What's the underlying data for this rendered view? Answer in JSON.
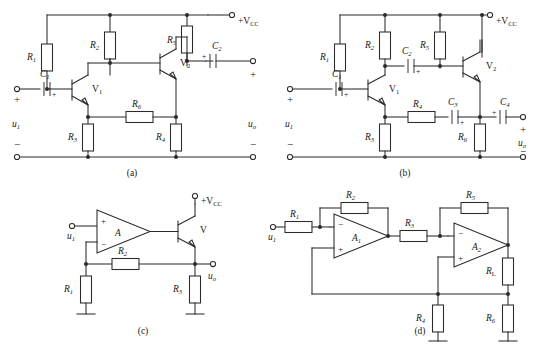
{
  "figure": {
    "type": "electronic-circuit-schematic-sheet",
    "panel_count": 4,
    "captions": [
      "(a)",
      "(b)",
      "(c)",
      "(d)"
    ]
  },
  "common": {
    "supply_label": "+V",
    "supply_sub": "CC",
    "input_label": "u",
    "input_sub": "1",
    "output_label": "u",
    "output_sub": "o",
    "plus": "+",
    "minus": "−"
  },
  "panel_a": {
    "caption": "(a)",
    "description": "Two-stage RC-coupled BJT amplifier with emitter feedback resistor",
    "supply": "+V",
    "supply_sub": "CC",
    "input_label": "u",
    "input_sub": "1",
    "output_label": "u",
    "output_sub": "o",
    "components": [
      {
        "name": "R",
        "sub": "1",
        "kind": "resistor",
        "orient": "vertical"
      },
      {
        "name": "R",
        "sub": "2",
        "kind": "resistor",
        "orient": "vertical"
      },
      {
        "name": "R",
        "sub": "3",
        "kind": "resistor",
        "orient": "vertical"
      },
      {
        "name": "R",
        "sub": "4",
        "kind": "resistor",
        "orient": "vertical"
      },
      {
        "name": "R",
        "sub": "5",
        "kind": "resistor",
        "orient": "vertical"
      },
      {
        "name": "R",
        "sub": "6",
        "kind": "resistor",
        "orient": "horizontal"
      },
      {
        "name": "C",
        "sub": "1",
        "kind": "capacitor-polarized",
        "orient": "horizontal"
      },
      {
        "name": "C",
        "sub": "2",
        "kind": "capacitor-polarized",
        "orient": "horizontal"
      },
      {
        "name": "V",
        "sub": "1",
        "kind": "transistor-npn"
      },
      {
        "name": "V",
        "sub": "2",
        "kind": "transistor-npn"
      }
    ]
  },
  "panel_b": {
    "caption": "(b)",
    "description": "Two-stage BJT amplifier with bypass capacitors and series feedback network",
    "supply": "+V",
    "supply_sub": "CC",
    "input_label": "u",
    "input_sub": "1",
    "output_label": "u",
    "output_sub": "o",
    "components": [
      {
        "name": "R",
        "sub": "1",
        "kind": "resistor",
        "orient": "vertical"
      },
      {
        "name": "R",
        "sub": "2",
        "kind": "resistor",
        "orient": "vertical"
      },
      {
        "name": "R",
        "sub": "3",
        "kind": "resistor",
        "orient": "vertical"
      },
      {
        "name": "R",
        "sub": "4",
        "kind": "resistor",
        "orient": "horizontal"
      },
      {
        "name": "R",
        "sub": "5",
        "kind": "resistor",
        "orient": "vertical"
      },
      {
        "name": "R",
        "sub": "6",
        "kind": "resistor",
        "orient": "vertical"
      },
      {
        "name": "C",
        "sub": "1",
        "kind": "capacitor-polarized",
        "orient": "horizontal"
      },
      {
        "name": "C",
        "sub": "2",
        "kind": "capacitor-polarized",
        "orient": "horizontal"
      },
      {
        "name": "C",
        "sub": "3",
        "kind": "capacitor-polarized",
        "orient": "horizontal"
      },
      {
        "name": "C",
        "sub": "4",
        "kind": "capacitor-polarized",
        "orient": "horizontal"
      },
      {
        "name": "V",
        "sub": "1",
        "kind": "transistor-npn"
      },
      {
        "name": "V",
        "sub": "2",
        "kind": "transistor-npn"
      }
    ]
  },
  "panel_c": {
    "caption": "(c)",
    "description": "Op-amp with BJT output booster and resistive feedback",
    "supply": "+V",
    "supply_sub": "CC",
    "input_label": "u",
    "input_sub": "1",
    "output_label": "u",
    "output_sub": "o",
    "opamp_label": "A",
    "opamp_plus": "+",
    "opamp_minus": "−",
    "transistor_label": "V",
    "components": [
      {
        "name": "R",
        "sub": "1",
        "kind": "resistor",
        "orient": "vertical"
      },
      {
        "name": "R",
        "sub": "2",
        "kind": "resistor",
        "orient": "horizontal"
      },
      {
        "name": "R",
        "sub": "3",
        "kind": "resistor",
        "orient": "vertical"
      },
      {
        "name": "V",
        "sub": "",
        "kind": "transistor-npn"
      }
    ]
  },
  "panel_d": {
    "caption": "(d)",
    "description": "Two op-amp cascade forming a current-source / feedback amplifier driving load R_L",
    "input_label": "u",
    "input_sub": "1",
    "opamp1_label": "A",
    "opamp1_sub": "1",
    "opamp2_label": "A",
    "opamp2_sub": "2",
    "opamp_plus": "+",
    "opamp_minus": "−",
    "components": [
      {
        "name": "R",
        "sub": "1",
        "kind": "resistor",
        "orient": "horizontal"
      },
      {
        "name": "R",
        "sub": "2",
        "kind": "resistor",
        "orient": "horizontal"
      },
      {
        "name": "R",
        "sub": "3",
        "kind": "resistor",
        "orient": "horizontal"
      },
      {
        "name": "R",
        "sub": "4",
        "kind": "resistor",
        "orient": "vertical"
      },
      {
        "name": "R",
        "sub": "5",
        "kind": "resistor",
        "orient": "horizontal"
      },
      {
        "name": "R",
        "sub": "6",
        "kind": "resistor",
        "orient": "vertical"
      },
      {
        "name": "R",
        "sub": "L",
        "sub_italic": false,
        "kind": "resistor",
        "orient": "vertical"
      }
    ]
  },
  "labels": {
    "a_R1": "R",
    "a_R1s": "1",
    "a_R2": "R",
    "a_R2s": "2",
    "a_R3": "R",
    "a_R3s": "3",
    "a_R4": "R",
    "a_R4s": "4",
    "a_R5": "R",
    "a_R5s": "5",
    "a_R6": "R",
    "a_R6s": "6",
    "a_C1": "C",
    "a_C1s": "1",
    "a_C2": "C",
    "a_C2s": "2",
    "a_V1": "V",
    "a_V1s": "1",
    "a_V2": "V",
    "a_V2s": "2",
    "b_R1": "R",
    "b_R1s": "1",
    "b_R2": "R",
    "b_R2s": "2",
    "b_R3": "R",
    "b_R3s": "3",
    "b_R4": "R",
    "b_R4s": "4",
    "b_R5": "R",
    "b_R5s": "5",
    "b_R6": "R",
    "b_R6s": "6",
    "b_C1": "C",
    "b_C1s": "1",
    "b_C2": "C",
    "b_C2s": "2",
    "b_C3": "C",
    "b_C3s": "3",
    "b_C4": "C",
    "b_C4s": "4",
    "b_V1": "V",
    "b_V1s": "1",
    "b_V2": "V",
    "b_V2s": "2",
    "c_R1": "R",
    "c_R1s": "1",
    "c_R2": "R",
    "c_R2s": "2",
    "c_R3": "R",
    "c_R3s": "3",
    "c_A": "A",
    "c_V": "V",
    "d_R1": "R",
    "d_R1s": "1",
    "d_R2": "R",
    "d_R2s": "2",
    "d_R3": "R",
    "d_R3s": "3",
    "d_R4": "R",
    "d_R4s": "4",
    "d_R5": "R",
    "d_R5s": "5",
    "d_R6": "R",
    "d_R6s": "6",
    "d_RL": "R",
    "d_RLs": "L",
    "d_A1": "A",
    "d_A1s": "1",
    "d_A2": "A",
    "d_A2s": "2"
  },
  "colors": {
    "ink": "#2b2b2b",
    "text": "#1a1a1a",
    "background": "#ffffff"
  }
}
